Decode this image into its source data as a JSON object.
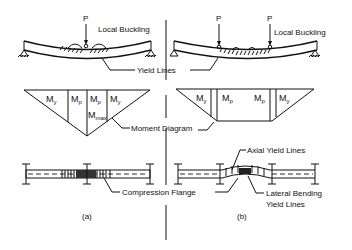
{
  "figure": {
    "panels": [
      {
        "id": "a",
        "caption": "(a)",
        "load_labels": [
          "P"
        ],
        "beam_label": "Local Buckling",
        "moment_labels": [
          "My",
          "Mp",
          "Mp",
          "My"
        ],
        "max_label": "Mmax",
        "plan_label": "Compression Flange"
      },
      {
        "id": "b",
        "caption": "(b)",
        "load_labels": [
          "P",
          "P"
        ],
        "beam_label": "Local Buckling",
        "moment_labels": [
          "My",
          "Mp",
          "Mp",
          "My"
        ],
        "plan_labels": [
          "Axial Yield Lines",
          "Lateral Bending",
          "Yield Lines"
        ]
      }
    ],
    "shared_labels": {
      "yield_lines": "Yield Lines",
      "moment_diagram": "Moment Diagram"
    }
  },
  "text": {
    "p_a": "P",
    "p_b1": "P",
    "p_b2": "P",
    "local_buckling_a": "Local Buckling",
    "local_buckling_b": "Local Buckling",
    "yield_lines": "Yield Lines",
    "moment_diagram": "Moment Diagram",
    "a_my1": "M",
    "a_my1_sub": "y",
    "a_mp1": "M",
    "a_mp1_sub": "p",
    "a_mp2": "M",
    "a_mp2_sub": "p",
    "a_my2": "M",
    "a_my2_sub": "y",
    "a_mmax": "M",
    "a_mmax_sub": "max",
    "b_my1": "M",
    "b_my1_sub": "y",
    "b_mp1": "M",
    "b_mp1_sub": "p",
    "b_mp2": "M",
    "b_mp2_sub": "p",
    "b_my2": "M",
    "b_my2_sub": "y",
    "axial_yield_lines": "Axial Yield Lines",
    "compression_flange": "Compression Flange",
    "lateral_bending": "Lateral Bending",
    "yield_lines_2": "Yield Lines",
    "caption_a": "(a)",
    "caption_b": "(b)"
  }
}
